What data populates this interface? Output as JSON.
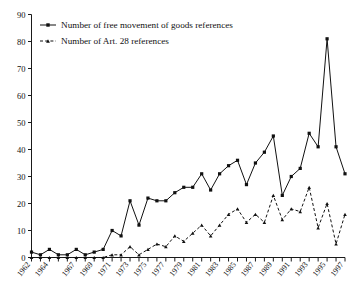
{
  "chart_data": {
    "type": "line",
    "title": "",
    "xlabel": "",
    "ylabel": "",
    "ylim": [
      0,
      90
    ],
    "ytick_step": 10,
    "yticks": [
      0,
      10,
      20,
      30,
      40,
      50,
      60,
      70,
      80,
      90
    ],
    "grid": false,
    "legend_position": "top-left",
    "x": [
      1962,
      1963,
      1964,
      1965,
      1966,
      1967,
      1968,
      1969,
      1970,
      1971,
      1972,
      1973,
      1974,
      1975,
      1976,
      1977,
      1978,
      1979,
      1980,
      1981,
      1982,
      1983,
      1984,
      1985,
      1986,
      1987,
      1988,
      1989,
      1990,
      1991,
      1992,
      1993,
      1994,
      1995,
      1996,
      1997
    ],
    "xtick_labels": [
      "1962",
      "1964",
      "1967",
      "1969",
      "1971",
      "1973",
      "1975",
      "1977",
      "1979",
      "1981",
      "1983",
      "1985",
      "1987",
      "1989",
      "1991",
      "1993",
      "1995",
      "1997"
    ],
    "xtick_label_years": [
      1962,
      1964,
      1967,
      1969,
      1971,
      1973,
      1975,
      1977,
      1979,
      1981,
      1983,
      1985,
      1987,
      1989,
      1991,
      1993,
      1995,
      1997
    ],
    "series": [
      {
        "name": "Number of free movement of goods references",
        "marker": "square",
        "line": "solid",
        "color": "#111111",
        "values": [
          2,
          1,
          3,
          1,
          1,
          3,
          1,
          2,
          3,
          10,
          8,
          21,
          12,
          22,
          21,
          21,
          24,
          26,
          26,
          31,
          25,
          31,
          34,
          36,
          27,
          35,
          39,
          45,
          23,
          30,
          33,
          46,
          41,
          81,
          41,
          31
        ]
      },
      {
        "name": "Number of Art. 28 references",
        "marker": "triangle",
        "line": "dashed",
        "color": "#111111",
        "values": [
          0,
          0,
          0,
          0,
          0,
          0,
          0,
          0,
          0,
          1,
          1,
          4,
          1,
          3,
          5,
          4,
          8,
          6,
          9,
          12,
          8,
          12,
          16,
          18,
          13,
          16,
          13,
          23,
          14,
          18,
          17,
          26,
          11,
          20,
          5,
          16
        ]
      }
    ],
    "legend": [
      {
        "label": "Number of free movement of goods references",
        "marker": "square",
        "line": "solid"
      },
      {
        "label": "Number of Art. 28 references",
        "marker": "triangle",
        "line": "dashed"
      }
    ]
  }
}
